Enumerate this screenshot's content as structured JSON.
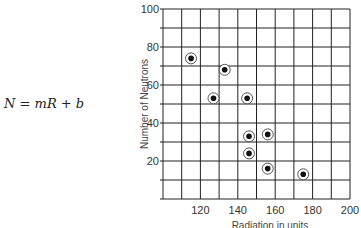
{
  "equation": {
    "lhs": "N",
    "eq": " = ",
    "m": "m",
    "R": "R",
    "plus": " + ",
    "b": "b"
  },
  "colors": {
    "grid": "#222222",
    "point": "#111111",
    "text": "#333333"
  },
  "chart_data": {
    "type": "scatter",
    "title": "",
    "xlabel": "Radiation in units",
    "ylabel": "Number of Neutrons",
    "xlim": [
      100,
      200
    ],
    "ylim": [
      0,
      100
    ],
    "x_ticks": [
      120,
      140,
      160,
      180,
      200
    ],
    "y_ticks": [
      20,
      40,
      60,
      80,
      100
    ],
    "grid": true,
    "grid_step": {
      "x": 10,
      "y": 10
    },
    "marker": "circled-dot",
    "series": [
      {
        "name": "measurements",
        "points": [
          {
            "x": 115,
            "y": 74
          },
          {
            "x": 133,
            "y": 68
          },
          {
            "x": 127,
            "y": 53
          },
          {
            "x": 145,
            "y": 53
          },
          {
            "x": 146,
            "y": 33
          },
          {
            "x": 156,
            "y": 34
          },
          {
            "x": 146,
            "y": 24
          },
          {
            "x": 156,
            "y": 16
          },
          {
            "x": 175,
            "y": 13
          }
        ]
      }
    ]
  }
}
